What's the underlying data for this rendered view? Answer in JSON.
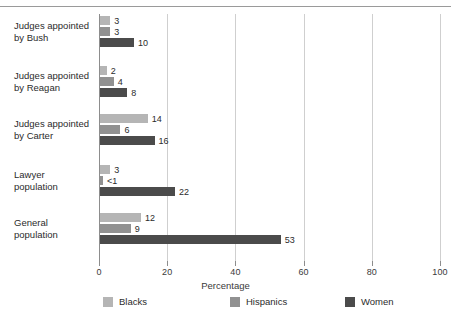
{
  "chart_data": {
    "type": "bar",
    "orientation": "horizontal",
    "title": "",
    "xlabel": "Percentage",
    "ylabel": "",
    "xlim": [
      0,
      100
    ],
    "xticks": [
      0,
      20,
      40,
      60,
      80,
      100
    ],
    "xtick_labels": [
      "0",
      "20",
      "40",
      "60",
      "80",
      "100"
    ],
    "grid": true,
    "grid_axis": "x",
    "legend_position": "bottom",
    "categories": [
      "Judges appointed by Bush",
      "Judges appointed by Reagan",
      "Judges appointed by Carter",
      "Lawyer population",
      "General population"
    ],
    "category_lines": [
      [
        "Judges appointed",
        "by Bush"
      ],
      [
        "Judges appointed",
        "by Reagan"
      ],
      [
        "Judges appointed",
        "by Carter"
      ],
      [
        "Lawyer",
        "population"
      ],
      [
        "General",
        "population"
      ]
    ],
    "series": [
      {
        "name": "Blacks",
        "color": "#b5b5b5",
        "values": [
          3,
          2,
          14,
          3,
          12
        ],
        "labels": [
          "3",
          "2",
          "14",
          "3",
          "12"
        ]
      },
      {
        "name": "Hispanics",
        "color": "#919191",
        "values": [
          3,
          4,
          6,
          0.5,
          9
        ],
        "labels": [
          "3",
          "4",
          "6",
          "<1",
          "9"
        ]
      },
      {
        "name": "Women",
        "color": "#4b4b4b",
        "values": [
          10,
          8,
          16,
          22,
          53
        ],
        "labels": [
          "10",
          "8",
          "16",
          "22",
          "53"
        ]
      }
    ]
  },
  "colors": {
    "blacks": "#b5b5b5",
    "hispanics": "#919191",
    "women": "#4b4b4b",
    "axis": "#8d8d8d",
    "grid": "#cfcfcf",
    "rule": "#9a9a9a",
    "text": "#2b2b2b"
  }
}
